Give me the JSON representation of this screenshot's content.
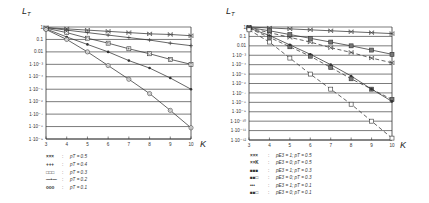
{
  "chart_data": [
    {
      "type": "line",
      "title": "",
      "ylabel": "L_T",
      "xlabel": "K",
      "yscale": "log",
      "ylim": [
        1e-09,
        1
      ],
      "xlim": [
        3,
        10
      ],
      "grid": true,
      "legend_position": "bottom-left",
      "x_ticks": [
        "3",
        "4",
        "5",
        "6",
        "7",
        "8",
        "9",
        "10"
      ],
      "y_ticks": [
        "1",
        "0.1",
        "0.01",
        "1·10⁻³",
        "1·10⁻⁴",
        "1·10⁻⁵",
        "1·10⁻⁶",
        "1·10⁻⁷",
        "1·10⁻⁸",
        "1·10⁻⁹"
      ],
      "x": [
        3,
        4,
        5,
        6,
        7,
        8,
        9,
        10
      ],
      "series": [
        {
          "name": "p_T = 0.5",
          "marker": "x",
          "dash": false,
          "log10_values": [
            -0.05,
            -0.15,
            -0.25,
            -0.35,
            -0.45,
            -0.55,
            -0.6,
            -0.7
          ]
        },
        {
          "name": "p_T = 0.4",
          "marker": "plus",
          "dash": false,
          "log10_values": [
            -0.05,
            -0.25,
            -0.45,
            -0.65,
            -0.85,
            -1.05,
            -1.3,
            -1.5
          ]
        },
        {
          "name": "p_T = 0.3",
          "marker": "square",
          "dash": false,
          "log10_values": [
            -0.1,
            -0.45,
            -0.9,
            -1.3,
            -1.75,
            -2.15,
            -2.6,
            -3.0
          ]
        },
        {
          "name": "p_T = 0.2",
          "marker": "dot",
          "dash": false,
          "log10_values": [
            -0.15,
            -0.8,
            -1.4,
            -2.0,
            -2.7,
            -3.3,
            -4.1,
            -5.0
          ]
        },
        {
          "name": "p_T = 0.1",
          "marker": "circle",
          "dash": false,
          "log10_values": [
            -0.2,
            -1.0,
            -2.0,
            -3.1,
            -4.2,
            -5.35,
            -6.7,
            -8.1
          ]
        }
      ],
      "legend": [
        {
          "symbol": "××× ",
          "label": "p_T = 0.5"
        },
        {
          "symbol": "+++",
          "label": "p_T = 0.4"
        },
        {
          "symbol": "□□□",
          "label": "p_T = 0.3"
        },
        {
          "symbol": "—•—",
          "label": "p_T = 0.2"
        },
        {
          "symbol": "ooo",
          "label": "p_T = 0.1"
        }
      ]
    },
    {
      "type": "line",
      "title": "",
      "ylabel": "L_T",
      "xlabel": "K",
      "yscale": "log",
      "ylim": [
        1e-12,
        1
      ],
      "xlim": [
        3,
        10
      ],
      "grid": true,
      "legend_position": "bottom-left",
      "x_ticks": [
        "3",
        "4",
        "5",
        "6",
        "7",
        "8",
        "9",
        "10"
      ],
      "y_ticks": [
        "1",
        "0.1",
        "0.01",
        "1·10⁻³",
        "1·10⁻⁴",
        "1·10⁻⁵",
        "1·10⁻⁶",
        "1·10⁻⁷",
        "1·10⁻⁸",
        "1·10⁻⁹",
        "1·10⁻¹⁰",
        "1·10⁻¹¹",
        "1·10⁻¹²"
      ],
      "x": [
        3,
        4,
        5,
        6,
        7,
        8,
        9,
        10
      ],
      "series": [
        {
          "name": "p_E3 = 1; p_T = 0.5",
          "marker": "x",
          "dash": false,
          "log10_values": [
            0,
            -0.1,
            -0.2,
            -0.3,
            -0.4,
            -0.5,
            -0.6,
            -0.7
          ]
        },
        {
          "name": "p_E3 = 0; p_T = 0.5",
          "marker": "x",
          "dash": true,
          "log10_values": [
            -0.1,
            -0.6,
            -1.1,
            -1.6,
            -2.2,
            -2.7,
            -3.3,
            -3.8
          ]
        },
        {
          "name": "p_E3 = 1; p_T = 0.3",
          "marker": "square-filled",
          "dash": false,
          "log10_values": [
            -0.05,
            -0.4,
            -0.8,
            -1.2,
            -1.6,
            -2.0,
            -2.45,
            -2.9
          ]
        },
        {
          "name": "p_E3 = 0; p_T = 0.3",
          "marker": "square-filled",
          "dash": true,
          "log10_values": [
            -0.15,
            -1.1,
            -2.1,
            -3.1,
            -4.3,
            -5.5,
            -6.6,
            -7.7
          ]
        },
        {
          "name": "p_E3 = 1; p_T = 0.1",
          "marker": "dot",
          "dash": false,
          "log10_values": [
            -0.1,
            -0.9,
            -1.9,
            -2.9,
            -4.0,
            -5.2,
            -6.6,
            -7.9
          ]
        },
        {
          "name": "p_E3 = 0; p_T = 0.1",
          "marker": "square-open",
          "dash": true,
          "log10_values": [
            -0.3,
            -1.6,
            -3.3,
            -5.0,
            -6.6,
            -8.2,
            -10.0,
            -11.8
          ]
        }
      ],
      "legend": [
        {
          "symbol": "×××",
          "label": "p_E3 = 1; p_T = 0.5"
        },
        {
          "symbol": "××K",
          "label": "p_E3 = 0; p_T = 0.5"
        },
        {
          "symbol": "■■■",
          "label": "p_E3 = 1; p_T = 0.3"
        },
        {
          "symbol": "■■□",
          "label": "p_E3 = 0; p_T = 0.3"
        },
        {
          "symbol": "•••",
          "label": "p_E3 = 1; p_T = 0.1"
        },
        {
          "symbol": "■■□",
          "label": "p_E3 = 0; p_T = 0.1"
        }
      ]
    }
  ]
}
